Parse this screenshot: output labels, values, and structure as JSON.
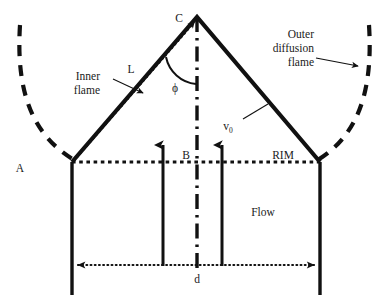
{
  "figure": {
    "kind": "bunsen-burner-flame-schematic",
    "background_color": "#ffffff",
    "line_color": "#111111"
  },
  "labels": {
    "point_a": "A",
    "point_b": "B",
    "point_c": "C",
    "length_l": "L",
    "angle_phi": "ϕ",
    "velocity": "v",
    "velocity_subscript": "0",
    "rim": "RIM",
    "flow": "Flow",
    "diameter": "d",
    "inner_flame_line1": "Inner",
    "inner_flame_line2": "flame",
    "outer_flame_line1": "Outer",
    "outer_flame_line2": "diffusion",
    "outer_flame_line3": "flame"
  },
  "geometry": {
    "apex": [
      197,
      17
    ],
    "left_vertex": [
      72,
      162
    ],
    "right_vertex": [
      320,
      162
    ],
    "rim_y": 162,
    "burner_bottom_y": 295,
    "dimension_y": 265,
    "flow_arrow_x": [
      163,
      222
    ],
    "flow_arrow_top_y": 140,
    "flow_arrow_bottom_y": 266,
    "centerline_x": 197,
    "centerline_top_y": 17,
    "centerline_bottom_y": 272
  },
  "elements": {
    "inner_flame_cone": "solid thick V from left vertex to apex to right vertex",
    "inner_flame_dotted": "dotted line from left vertex to apex with arrowhead at C",
    "outer_diffusion_curves": "two dashed parabolic arcs flanking the cone",
    "centerline": "vertical dash-dot axis of symmetry",
    "rim_line": "horizontal dotted line at burner rim",
    "diameter_line": "horizontal dotted double-headed arrow labelled d",
    "flow_arrows": "two upward solid arrows inside burner tube",
    "angle_arc": "arc between flame surface and centerline marking phi"
  }
}
